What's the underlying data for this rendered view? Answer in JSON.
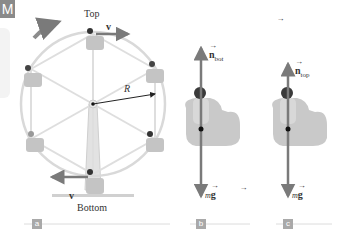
{
  "badge": {
    "text": "M"
  },
  "panel_a": {
    "tag": "a",
    "labels": {
      "top": "Top",
      "bottom": "Bottom",
      "radius": "R",
      "velocity_top": "v",
      "velocity_bottom": "v"
    },
    "rotation_direction": "clockwise"
  },
  "panel_b": {
    "tag": "b",
    "normal_force": {
      "symbol": "n",
      "subscript": "bot"
    },
    "weight": {
      "prefix": "m",
      "symbol": "g"
    }
  },
  "panel_c": {
    "tag": "c",
    "normal_force": {
      "symbol": "n",
      "subscript": "top"
    },
    "weight": {
      "prefix": "m",
      "symbol": "g"
    }
  },
  "colors": {
    "arrow": "#7a7a7a",
    "wheel": "#d4d4d4",
    "seat": "#bdbdbd",
    "badge": "#8a8a8a",
    "text": "#333333"
  }
}
